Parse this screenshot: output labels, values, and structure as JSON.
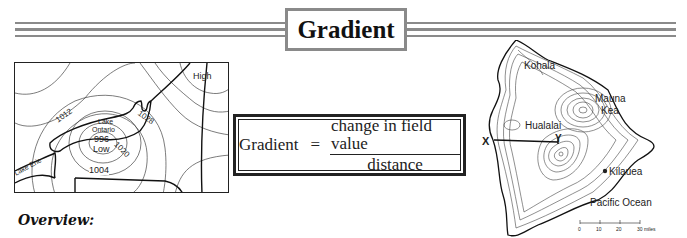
{
  "header": {
    "title": "Gradient"
  },
  "weather_map": {
    "labels": {
      "high": "High",
      "low": "Low",
      "lake_ontario_1": "Lake",
      "lake_ontario_2": "Ontario",
      "lake_erie": "Lake Erie",
      "isobar_996": "996",
      "isobar_1004": "1004",
      "isobar_1012": "1012",
      "isobar_1020": "1020",
      "isobar_1028": "1028"
    }
  },
  "formula": {
    "lhs": "Gradient",
    "equals": "=",
    "numerator": "change in field value",
    "denominator": "distance"
  },
  "topo_map": {
    "labels": {
      "kohala": "Kohala",
      "mauna_kea_1": "Mauna",
      "mauna_kea_2": "Kea",
      "hualalai": "Hualalai",
      "kilauea": "Kilauea",
      "pacific_ocean": "Pacific Ocean",
      "point_x": "X",
      "point_y": "Y"
    },
    "scale": {
      "ticks": [
        "0",
        "10",
        "20",
        "30 miles"
      ]
    }
  },
  "section": {
    "overview_heading": "Overview:"
  }
}
